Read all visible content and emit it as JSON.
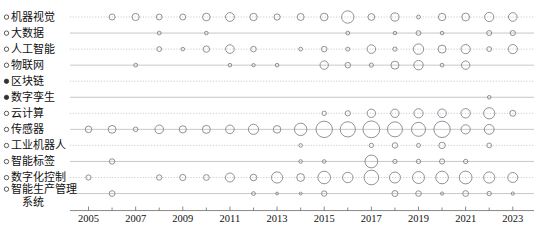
{
  "chart_data": {
    "type": "scatter",
    "title": "",
    "subtitle": "",
    "xlabel": "",
    "ylabel": "",
    "xlim": [
      2004.3,
      2023.9
    ],
    "ylim_categories_top_to_bottom": true,
    "grid": true,
    "legend": "none",
    "x_tick_labels": [
      "2005",
      "2007",
      "2009",
      "2011",
      "2013",
      "2015",
      "2017",
      "2019",
      "2021",
      "2023"
    ],
    "x_tick_values": [
      2005,
      2007,
      2009,
      2011,
      2013,
      2015,
      2017,
      2019,
      2021,
      2023
    ],
    "x_minor_values": [
      2006,
      2008,
      2010,
      2012,
      2014,
      2016,
      2018,
      2020,
      2022
    ],
    "categories": [
      {
        "label": "机器视觉",
        "marker": "open"
      },
      {
        "label": "大数据",
        "marker": "open"
      },
      {
        "label": "人工智能",
        "marker": "open"
      },
      {
        "label": "物联网",
        "marker": "open"
      },
      {
        "label": "区块链",
        "marker": "solid"
      },
      {
        "label": "数字孪生",
        "marker": "solid"
      },
      {
        "label": "云计算",
        "marker": "open"
      },
      {
        "label": "传感器",
        "marker": "open"
      },
      {
        "label": "工业机器人",
        "marker": "open"
      },
      {
        "label": "智能标签",
        "marker": "open"
      },
      {
        "label": "数字化控制",
        "marker": "open"
      },
      {
        "label": "智能生产管理系统",
        "marker": "open"
      }
    ],
    "series": [
      {
        "name": "机器视觉",
        "points": [
          {
            "x": 2006,
            "r": 3.0
          },
          {
            "x": 2007,
            "r": 3.6
          },
          {
            "x": 2008,
            "r": 2.9
          },
          {
            "x": 2009,
            "r": 3.0
          },
          {
            "x": 2010,
            "r": 3.8
          },
          {
            "x": 2011,
            "r": 4.4
          },
          {
            "x": 2012,
            "r": 3.7
          },
          {
            "x": 2013,
            "r": 3.1
          },
          {
            "x": 2014,
            "r": 3.5
          },
          {
            "x": 2015,
            "r": 3.8
          },
          {
            "x": 2016,
            "r": 6.2
          },
          {
            "x": 2017,
            "r": 3.4
          },
          {
            "x": 2018,
            "r": 4.1
          },
          {
            "x": 2019,
            "r": 1.9
          },
          {
            "x": 2020,
            "r": 3.7
          },
          {
            "x": 2021,
            "r": 3.9
          },
          {
            "x": 2022,
            "r": 4.6
          },
          {
            "x": 2023,
            "r": 4.3
          }
        ]
      },
      {
        "name": "大数据",
        "points": [
          {
            "x": 2008,
            "r": 1.9
          },
          {
            "x": 2010,
            "r": 1.8
          },
          {
            "x": 2016,
            "r": 1.9
          },
          {
            "x": 2018,
            "r": 1.7
          },
          {
            "x": 2019,
            "r": 2.4
          },
          {
            "x": 2020,
            "r": 1.8
          },
          {
            "x": 2022,
            "r": 2.5
          },
          {
            "x": 2023,
            "r": 2.6
          }
        ]
      },
      {
        "name": "人工智能",
        "points": [
          {
            "x": 2008,
            "r": 2.4
          },
          {
            "x": 2009,
            "r": 1.8
          },
          {
            "x": 2010,
            "r": 3.2
          },
          {
            "x": 2011,
            "r": 4.3
          },
          {
            "x": 2012,
            "r": 2.8
          },
          {
            "x": 2014,
            "r": 1.9
          },
          {
            "x": 2015,
            "r": 2.8
          },
          {
            "x": 2016,
            "r": 2.0
          },
          {
            "x": 2017,
            "r": 4.3
          },
          {
            "x": 2018,
            "r": 2.1
          },
          {
            "x": 2019,
            "r": 5.2
          },
          {
            "x": 2020,
            "r": 4.0
          },
          {
            "x": 2021,
            "r": 4.6
          },
          {
            "x": 2022,
            "r": 2.4
          },
          {
            "x": 2023,
            "r": 4.6
          }
        ]
      },
      {
        "name": "物联网",
        "points": [
          {
            "x": 2007,
            "r": 1.9
          },
          {
            "x": 2011,
            "r": 1.8
          },
          {
            "x": 2012,
            "r": 1.7
          },
          {
            "x": 2013,
            "r": 1.8
          },
          {
            "x": 2015,
            "r": 4.2
          },
          {
            "x": 2016,
            "r": 2.8
          },
          {
            "x": 2017,
            "r": 2.1
          },
          {
            "x": 2018,
            "r": 4.0
          },
          {
            "x": 2019,
            "r": 4.7
          },
          {
            "x": 2020,
            "r": 1.9
          },
          {
            "x": 2021,
            "r": 4.2
          }
        ]
      },
      {
        "name": "区块链",
        "points": []
      },
      {
        "name": "数字孪生",
        "points": [
          {
            "x": 2022,
            "r": 1.8
          }
        ]
      },
      {
        "name": "云计算",
        "points": [
          {
            "x": 2015,
            "r": 2.2
          },
          {
            "x": 2016,
            "r": 2.6
          },
          {
            "x": 2017,
            "r": 4.2
          },
          {
            "x": 2018,
            "r": 4.2
          },
          {
            "x": 2019,
            "r": 4.6
          },
          {
            "x": 2020,
            "r": 4.3
          },
          {
            "x": 2021,
            "r": 4.7
          },
          {
            "x": 2022,
            "r": 5.6
          },
          {
            "x": 2023,
            "r": 3.0
          }
        ]
      },
      {
        "name": "传感器",
        "points": [
          {
            "x": 2005,
            "r": 3.3
          },
          {
            "x": 2006,
            "r": 3.9
          },
          {
            "x": 2007,
            "r": 2.3
          },
          {
            "x": 2008,
            "r": 4.3
          },
          {
            "x": 2009,
            "r": 3.6
          },
          {
            "x": 2010,
            "r": 4.0
          },
          {
            "x": 2011,
            "r": 4.3
          },
          {
            "x": 2012,
            "r": 5.1
          },
          {
            "x": 2013,
            "r": 3.8
          },
          {
            "x": 2014,
            "r": 6.2
          },
          {
            "x": 2015,
            "r": 8.2
          },
          {
            "x": 2016,
            "r": 7.6
          },
          {
            "x": 2017,
            "r": 8.4
          },
          {
            "x": 2018,
            "r": 7.5
          },
          {
            "x": 2019,
            "r": 7.0
          },
          {
            "x": 2020,
            "r": 8.2
          },
          {
            "x": 2021,
            "r": 4.6
          },
          {
            "x": 2022,
            "r": 4.9
          }
        ]
      },
      {
        "name": "工业机器人",
        "points": [
          {
            "x": 2014,
            "r": 1.8
          },
          {
            "x": 2017,
            "r": 2.2
          },
          {
            "x": 2018,
            "r": 2.7
          },
          {
            "x": 2019,
            "r": 2.0
          },
          {
            "x": 2020,
            "r": 3.2
          },
          {
            "x": 2022,
            "r": 2.4
          }
        ]
      },
      {
        "name": "智能标签",
        "points": [
          {
            "x": 2006,
            "r": 2.7
          },
          {
            "x": 2014,
            "r": 1.8
          },
          {
            "x": 2015,
            "r": 1.8
          },
          {
            "x": 2017,
            "r": 6.4
          },
          {
            "x": 2018,
            "r": 2.1
          },
          {
            "x": 2019,
            "r": 2.2
          },
          {
            "x": 2020,
            "r": 2.6
          },
          {
            "x": 2021,
            "r": 2.2
          }
        ]
      },
      {
        "name": "数字化控制",
        "points": [
          {
            "x": 2005,
            "r": 2.6
          },
          {
            "x": 2008,
            "r": 2.7
          },
          {
            "x": 2009,
            "r": 3.1
          },
          {
            "x": 2010,
            "r": 2.9
          },
          {
            "x": 2011,
            "r": 4.5
          },
          {
            "x": 2012,
            "r": 3.3
          },
          {
            "x": 2013,
            "r": 5.6
          },
          {
            "x": 2014,
            "r": 3.9
          },
          {
            "x": 2015,
            "r": 6.3
          },
          {
            "x": 2016,
            "r": 5.2
          },
          {
            "x": 2017,
            "r": 7.3
          },
          {
            "x": 2018,
            "r": 5.5
          },
          {
            "x": 2019,
            "r": 6.0
          },
          {
            "x": 2020,
            "r": 6.3
          },
          {
            "x": 2021,
            "r": 6.4
          },
          {
            "x": 2022,
            "r": 5.6
          },
          {
            "x": 2023,
            "r": 5.0
          }
        ]
      },
      {
        "name": "智能生产管理系统",
        "points": [
          {
            "x": 2006,
            "r": 2.9
          },
          {
            "x": 2012,
            "r": 1.9
          },
          {
            "x": 2013,
            "r": 1.4
          },
          {
            "x": 2014,
            "r": 1.4
          },
          {
            "x": 2015,
            "r": 2.7
          },
          {
            "x": 2018,
            "r": 3.0
          },
          {
            "x": 2019,
            "r": 2.8
          },
          {
            "x": 2020,
            "r": 1.6
          },
          {
            "x": 2021,
            "r": 2.9
          },
          {
            "x": 2022,
            "r": 2.2
          },
          {
            "x": 2023,
            "r": 1.6
          }
        ]
      }
    ]
  },
  "colors": {
    "bubble_stroke": "#6e6e78",
    "grid": "#b8b8b8",
    "axis": "#6b6b6b",
    "text": "#111111",
    "background": "#ffffff"
  }
}
